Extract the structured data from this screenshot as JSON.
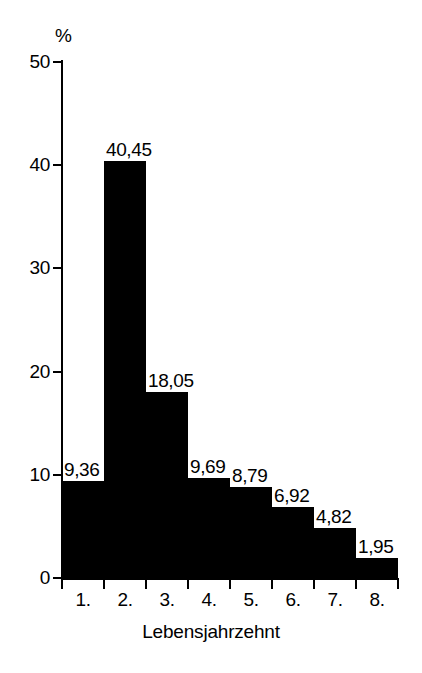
{
  "chart_data": {
    "type": "bar",
    "title": "",
    "subtitle": "",
    "xlabel": "Lebensjahrzehnt",
    "ylabel": "%",
    "categories": [
      "1.",
      "2.",
      "3.",
      "4.",
      "5.",
      "6.",
      "7.",
      "8."
    ],
    "values": [
      9.36,
      40.45,
      18.05,
      9.69,
      8.79,
      6.92,
      4.82,
      1.95
    ],
    "value_labels": [
      "9,36",
      "40,45",
      "18,05",
      "9,69",
      "8,79",
      "6,92",
      "4,82",
      "1,95"
    ],
    "ylim": [
      0,
      50
    ],
    "yticks": [
      0,
      10,
      20,
      30,
      40,
      50
    ],
    "ytick_labels": [
      "0",
      "10",
      "20",
      "30",
      "40",
      "50"
    ],
    "grid": false,
    "legend": "none",
    "bar_color": "#000000",
    "background_color": "#ffffff",
    "axis_color": "#000000",
    "decimal_separator": ","
  },
  "axes": {
    "y_axis_unit": "%",
    "x_axis_title": "Lebensjahrzehnt"
  }
}
